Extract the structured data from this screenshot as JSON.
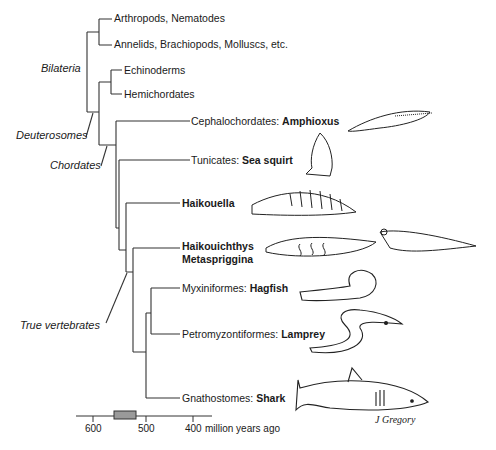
{
  "taxa": [
    {
      "prefix": "Arthropods, Nematodes",
      "bold": ""
    },
    {
      "prefix": "Annelids, Brachiopods, Molluscs, etc.",
      "bold": ""
    },
    {
      "prefix": "Echinoderms",
      "bold": ""
    },
    {
      "prefix": "Hemichordates",
      "bold": ""
    },
    {
      "prefix": "Cephalochordates: ",
      "bold": "Amphioxus"
    },
    {
      "prefix": "Tunicates: ",
      "bold": "Sea squirt"
    },
    {
      "prefix": "",
      "bold": "Haikouella"
    },
    {
      "prefix": "",
      "bold": "Haikouichthys"
    },
    {
      "prefix": "",
      "bold": "Metaspriggina"
    },
    {
      "prefix": "Myxiniformes: ",
      "bold": "Hagfish"
    },
    {
      "prefix": "Petromyzontiformes: ",
      "bold": "Lamprey"
    },
    {
      "prefix": "Gnathostomes: ",
      "bold": "Shark"
    }
  ],
  "clades": {
    "bilateria": "Bilateria",
    "deuterosomes": "Deuterosomes",
    "chordates": "Chordates",
    "true_vertebrates": "True vertebrates"
  },
  "time_axis": {
    "ticks": [
      "600",
      "500",
      "400"
    ],
    "unit": "million years ago",
    "highlight_range": "Cambrian band"
  },
  "credit": "J Gregory"
}
